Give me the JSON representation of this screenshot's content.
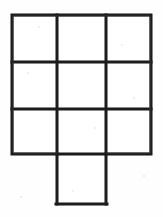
{
  "figure": {
    "description": "Hand-drawn scanned outline figure: a three-by-three grid of equal squares with one extra square attached below the bottom-middle square, forming a ten-square cross-like net.",
    "style": "scanned-ink-line-drawing",
    "colors": {
      "background": "#fefefe",
      "page": "#ffffff",
      "ink": "#1a1a1a",
      "ink_soft": "#3a3a38",
      "cell_fill": "#ffffff",
      "speckle": "#d8d8d6"
    },
    "canvas": {
      "width": 163,
      "height": 217
    },
    "grid": {
      "rows": 3,
      "cols": 3,
      "cell_count": 9,
      "left": 12,
      "top": 15,
      "right": 151,
      "bottom": 154,
      "x_lines": [
        12,
        57,
        106,
        151
      ],
      "y_lines": [
        15,
        62,
        109,
        154
      ],
      "stroke_width": 3
    },
    "tab": {
      "label": "bottom-center-tab",
      "attached_to": "bottom-middle-cell",
      "left": 57,
      "top": 154,
      "right": 106,
      "bottom": 205,
      "stroke_width": 3
    },
    "cells": [
      {
        "id": "r1c1",
        "row": 1,
        "col": 1,
        "x": 12,
        "y": 15,
        "w": 45,
        "h": 47
      },
      {
        "id": "r1c2",
        "row": 1,
        "col": 2,
        "x": 57,
        "y": 15,
        "w": 49,
        "h": 47
      },
      {
        "id": "r1c3",
        "row": 1,
        "col": 3,
        "x": 106,
        "y": 15,
        "w": 45,
        "h": 47
      },
      {
        "id": "r2c1",
        "row": 2,
        "col": 1,
        "x": 12,
        "y": 62,
        "w": 45,
        "h": 47
      },
      {
        "id": "r2c2",
        "row": 2,
        "col": 2,
        "x": 57,
        "y": 62,
        "w": 49,
        "h": 47
      },
      {
        "id": "r2c3",
        "row": 2,
        "col": 3,
        "x": 106,
        "y": 62,
        "w": 45,
        "h": 47
      },
      {
        "id": "r3c1",
        "row": 3,
        "col": 1,
        "x": 12,
        "y": 109,
        "w": 45,
        "h": 45
      },
      {
        "id": "r3c2",
        "row": 3,
        "col": 2,
        "x": 57,
        "y": 109,
        "w": 49,
        "h": 45
      },
      {
        "id": "r3c3",
        "row": 3,
        "col": 3,
        "x": 106,
        "y": 109,
        "w": 45,
        "h": 45
      },
      {
        "id": "tab",
        "row": 4,
        "col": 2,
        "x": 57,
        "y": 154,
        "w": 49,
        "h": 51
      }
    ],
    "specks": [
      {
        "x": 38,
        "y": 26,
        "d": 2
      },
      {
        "x": 27,
        "y": 72,
        "d": 2
      },
      {
        "x": 121,
        "y": 44,
        "d": 2
      },
      {
        "x": 94,
        "y": 127,
        "d": 2
      },
      {
        "x": 72,
        "y": 190,
        "d": 2
      },
      {
        "x": 143,
        "y": 175,
        "d": 2
      },
      {
        "x": 20,
        "y": 196,
        "d": 2
      },
      {
        "x": 133,
        "y": 97,
        "d": 2
      }
    ]
  }
}
